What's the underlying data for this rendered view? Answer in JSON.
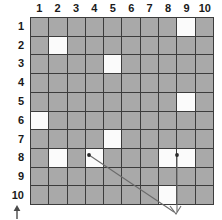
{
  "diagram": {
    "columns": [
      "1",
      "2",
      "3",
      "4",
      "5",
      "6",
      "7",
      "8",
      "9",
      "10"
    ],
    "rows": [
      "1",
      "2",
      "3",
      "4",
      "5",
      "6",
      "7",
      "8",
      "9",
      "10"
    ],
    "colors": {
      "filled_cell": "#a9a9a9",
      "empty_cell": "#fbfbfb",
      "grid_line": "#3c3c3c",
      "label_text": "#1a1a1a",
      "pointer_line": "#6b6b6b",
      "arrow": "#6b6b6b"
    },
    "cell_states": [
      [
        "filled",
        "filled",
        "filled",
        "filled",
        "filled",
        "filled",
        "filled",
        "filled",
        "empty",
        "filled"
      ],
      [
        "filled",
        "empty",
        "filled",
        "filled",
        "filled",
        "filled",
        "filled",
        "filled",
        "filled",
        "filled"
      ],
      [
        "filled",
        "filled",
        "filled",
        "filled",
        "empty",
        "filled",
        "filled",
        "filled",
        "filled",
        "filled"
      ],
      [
        "filled",
        "filled",
        "filled",
        "filled",
        "filled",
        "filled",
        "filled",
        "filled",
        "filled",
        "filled"
      ],
      [
        "filled",
        "filled",
        "filled",
        "filled",
        "filled",
        "filled",
        "filled",
        "filled",
        "empty",
        "filled"
      ],
      [
        "empty",
        "filled",
        "filled",
        "filled",
        "filled",
        "filled",
        "filled",
        "filled",
        "filled",
        "filled"
      ],
      [
        "filled",
        "filled",
        "filled",
        "filled",
        "empty",
        "filled",
        "filled",
        "filled",
        "filled",
        "filled"
      ],
      [
        "filled",
        "empty",
        "filled",
        "empty",
        "filled",
        "filled",
        "filled",
        "empty",
        "empty",
        "filled"
      ],
      [
        "filled",
        "filled",
        "filled",
        "filled",
        "filled",
        "filled",
        "filled",
        "filled",
        "filled",
        "filled"
      ],
      [
        "filled",
        "filled",
        "filled",
        "filled",
        "filled",
        "filled",
        "filled",
        "empty",
        "filled",
        "filled"
      ]
    ],
    "pointers": [
      {
        "name": "pointer-from-r8c4",
        "anchor_cell": "row 8, column 4",
        "dot": true
      },
      {
        "name": "pointer-from-r8c8",
        "anchor_cell": "row 8, column 8",
        "dot": true
      }
    ],
    "bottom_arrow": {
      "name": "up-arrow",
      "direction": "up"
    }
  }
}
